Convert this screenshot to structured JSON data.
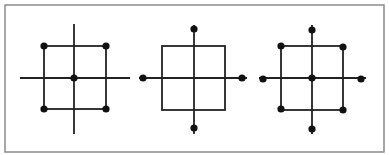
{
  "frame": {
    "x": 5,
    "y": 5,
    "width": 379,
    "height": 147,
    "stroke": "#8a8a8a"
  },
  "style": {
    "line_color": "#222222",
    "dot_color": "#111111",
    "line_width": 1.8,
    "dot_radius": 3.6
  },
  "figures": [
    {
      "name": "figure-square-corners-and-center",
      "square": {
        "x1": 44,
        "y1": 46,
        "x2": 106,
        "y2": 109
      },
      "vline": {
        "x": 74,
        "y1": 24,
        "y2": 134
      },
      "hline": {
        "y": 78,
        "x1": 20,
        "x2": 130
      },
      "dots": [
        {
          "name": "dot-top-left",
          "x": 44,
          "y": 46
        },
        {
          "name": "dot-top-right",
          "x": 106,
          "y": 46
        },
        {
          "name": "dot-bottom-left",
          "x": 44,
          "y": 109
        },
        {
          "name": "dot-bottom-right",
          "x": 106,
          "y": 109
        },
        {
          "name": "dot-center",
          "x": 74,
          "y": 78
        }
      ]
    },
    {
      "name": "figure-square-axis-endpoints",
      "square": {
        "x1": 162,
        "y1": 46,
        "x2": 225,
        "y2": 110
      },
      "vline": {
        "x": 194,
        "y1": 25,
        "y2": 134
      },
      "hline": {
        "y": 78,
        "x1": 139,
        "x2": 247
      },
      "dots": [
        {
          "name": "dot-top",
          "x": 194,
          "y": 29
        },
        {
          "name": "dot-bottom",
          "x": 194,
          "y": 128
        },
        {
          "name": "dot-left",
          "x": 143,
          "y": 78
        },
        {
          "name": "dot-right",
          "x": 242,
          "y": 78
        }
      ]
    },
    {
      "name": "figure-square-all-points",
      "square": {
        "x1": 281,
        "y1": 46,
        "x2": 343,
        "y2": 110
      },
      "vline": {
        "x": 312,
        "y1": 25,
        "y2": 134
      },
      "hline": {
        "y": 78,
        "x1": 259,
        "x2": 366
      },
      "dots": [
        {
          "name": "dot-top-left",
          "x": 281,
          "y": 46
        },
        {
          "name": "dot-top-right",
          "x": 343,
          "y": 47
        },
        {
          "name": "dot-bottom-left",
          "x": 281,
          "y": 109
        },
        {
          "name": "dot-bottom-right",
          "x": 343,
          "y": 110
        },
        {
          "name": "dot-center",
          "x": 312,
          "y": 78
        },
        {
          "name": "dot-top",
          "x": 312,
          "y": 30
        },
        {
          "name": "dot-bottom",
          "x": 312,
          "y": 129
        },
        {
          "name": "dot-left",
          "x": 263,
          "y": 79
        },
        {
          "name": "dot-right",
          "x": 361,
          "y": 79
        }
      ]
    }
  ]
}
